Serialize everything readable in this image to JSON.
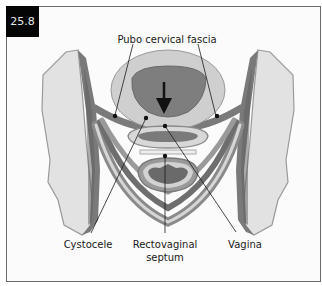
{
  "figure": {
    "number": "25.8"
  },
  "labels": {
    "top": "Pubo cervical fascia",
    "cystocele": "Cystocele",
    "rectovaginal_line1": "Rectovaginal",
    "rectovaginal_line2": "septum",
    "vagina": "Vagina"
  },
  "icons": {
    "descent_arrow": "down-arrow-icon"
  },
  "colors": {
    "badge_bg": "#050505",
    "bone_fill": "#e2e2e2",
    "muscle_dark": "#6e6e6e",
    "muscle_mid": "#8a8a8a",
    "fascia_light": "#cfcfcf",
    "frame_border": "#6a6a6a"
  }
}
